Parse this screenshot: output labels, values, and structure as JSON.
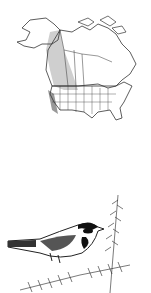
{
  "figure": {
    "map": {
      "subject": "range-map-north-america",
      "range_color": "#c8c8c8",
      "border_color": "#333333"
    },
    "illustration": {
      "subject": "warbler-on-conifer-branch",
      "ink_color": "#1a1a1a"
    }
  }
}
